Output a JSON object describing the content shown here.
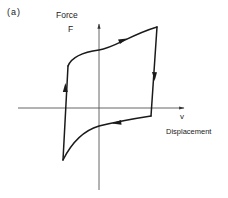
{
  "figure": {
    "panel_label": "(a)",
    "y_axis": {
      "label": "Force",
      "symbol": "F"
    },
    "x_axis": {
      "symbol": "v",
      "label": "Displacement"
    },
    "colors": {
      "curve": "#1a1a1a",
      "axes": "#555555",
      "background": "#ffffff"
    },
    "loop_direction": [
      "up-left-branch",
      "right-top-branch",
      "down-right-branch",
      "left-bottom-branch"
    ]
  }
}
